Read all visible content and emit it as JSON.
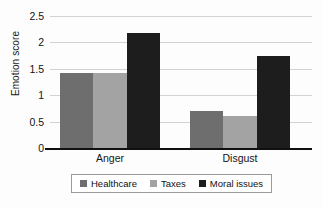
{
  "chart_data": {
    "type": "bar",
    "title": "",
    "xlabel": "",
    "ylabel": "Emotion score",
    "categories": [
      "Anger",
      "Disgust"
    ],
    "series": [
      {
        "name": "Healthcare",
        "color": "#6e6e6e",
        "values": [
          1.42,
          0.7
        ]
      },
      {
        "name": "Taxes",
        "color": "#a3a3a3",
        "values": [
          1.43,
          0.61
        ]
      },
      {
        "name": "Moral issues",
        "color": "#1d1d1d",
        "values": [
          2.17,
          1.74
        ]
      }
    ],
    "ylim": [
      0,
      2.5
    ],
    "yticks": [
      0,
      0.5,
      1,
      1.5,
      2,
      2.5
    ],
    "ytick_labels": [
      "0",
      "0.5",
      "1",
      "1.5",
      "2",
      "2.5"
    ],
    "grid": true,
    "legend_position": "bottom"
  }
}
